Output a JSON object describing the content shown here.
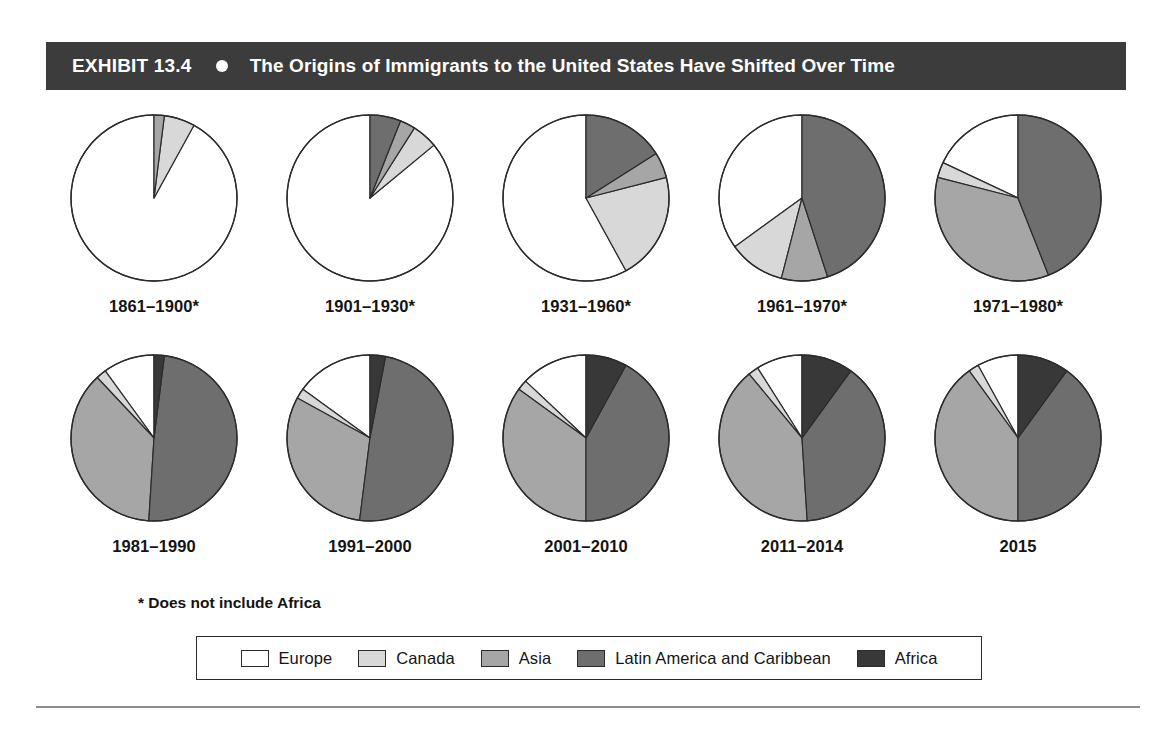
{
  "header": {
    "exhibit_number": "EXHIBIT 13.4",
    "bullet": "bullet-dot",
    "title": "The Origins of Immigrants to the United States Have Shifted Over Time",
    "background_color": "#3c3c3c",
    "text_color": "#ffffff"
  },
  "footnote": "* Does not include Africa",
  "legend": {
    "items": [
      {
        "label": "Europe",
        "color": "#ffffff"
      },
      {
        "label": "Canada",
        "color": "#d8d8d8"
      },
      {
        "label": "Asia",
        "color": "#a6a6a6"
      },
      {
        "label": "Latin America and Caribbean",
        "color": "#6e6e6e"
      },
      {
        "label": "Africa",
        "color": "#383838"
      }
    ]
  },
  "chart_data": {
    "type": "pie",
    "title": "The Origins of Immigrants to the United States Have Shifted Over Time",
    "subtitle": "EXHIBIT 13.4",
    "note": "* Does not include Africa",
    "legend_position": "bottom",
    "units": "percent of total immigrants",
    "categories": [
      "Europe",
      "Canada",
      "Asia",
      "Latin America and Caribbean",
      "Africa"
    ],
    "colors": [
      "#ffffff",
      "#d8d8d8",
      "#a6a6a6",
      "#6e6e6e",
      "#383838"
    ],
    "start_angle_deg": -90,
    "direction": "counterclockwise",
    "charts": [
      {
        "label": "1861–1900*",
        "values": [
          92,
          6,
          2,
          0,
          0
        ]
      },
      {
        "label": "1901–1930*",
        "values": [
          86,
          5,
          3,
          6,
          0
        ]
      },
      {
        "label": "1931–1960*",
        "values": [
          58,
          21,
          5,
          16,
          0
        ]
      },
      {
        "label": "1961–1970*",
        "values": [
          35,
          11,
          9,
          45,
          0
        ]
      },
      {
        "label": "1971–1980*",
        "values": [
          18,
          3,
          35,
          44,
          0
        ]
      },
      {
        "label": "1981–1990",
        "values": [
          10,
          2,
          37,
          49,
          2
        ]
      },
      {
        "label": "1991–2000",
        "values": [
          15,
          2,
          31,
          49,
          3
        ]
      },
      {
        "label": "2001–2010",
        "values": [
          13,
          2,
          35,
          42,
          8
        ]
      },
      {
        "label": "2011–2014",
        "values": [
          9,
          2,
          40,
          39,
          10
        ]
      },
      {
        "label": "2015",
        "values": [
          8,
          2,
          40,
          40,
          10
        ]
      }
    ]
  }
}
